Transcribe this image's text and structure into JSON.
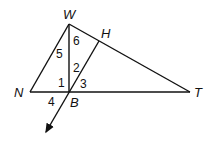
{
  "diagram": {
    "type": "geometry-triangle",
    "points": {
      "W": {
        "label": "W",
        "x": 69,
        "y": 24
      },
      "H": {
        "label": "H",
        "x": 99,
        "y": 41
      },
      "N": {
        "label": "N",
        "x": 30,
        "y": 92
      },
      "B": {
        "label": "B",
        "x": 69,
        "y": 92
      },
      "T": {
        "label": "T",
        "x": 190,
        "y": 92
      }
    },
    "segments": [
      "WN",
      "WT",
      "NT",
      "WB",
      "HB"
    ],
    "ray": {
      "from": "H",
      "through": "B",
      "arrow": true
    },
    "angles": [
      {
        "label": "1",
        "x": 58,
        "y": 87
      },
      {
        "label": "2",
        "x": 73,
        "y": 72
      },
      {
        "label": "3",
        "x": 80,
        "y": 88
      },
      {
        "label": "4",
        "x": 48,
        "y": 106
      },
      {
        "label": "5",
        "x": 57,
        "y": 58
      },
      {
        "label": "6",
        "x": 73,
        "y": 45
      }
    ]
  }
}
